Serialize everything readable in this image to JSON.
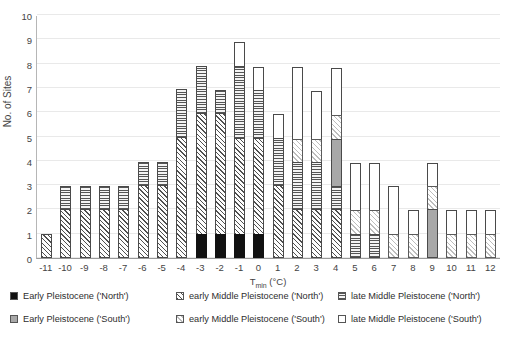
{
  "chart_data": {
    "type": "bar",
    "title": "",
    "xlabel": "Tmin (°C)",
    "xlabel_base": "T",
    "xlabel_sub": "min",
    "xlabel_unit": " (°C)",
    "ylabel": "No. of Sites",
    "ylim": [
      0,
      10
    ],
    "yticks": [
      0,
      1,
      2,
      3,
      4,
      5,
      6,
      7,
      8,
      9,
      10
    ],
    "grid": true,
    "legend_position": "bottom",
    "stacked": true,
    "categories": [
      "-11",
      "-10",
      "-9",
      "-8",
      "-7",
      "-6",
      "-5",
      "-4",
      "-3",
      "-2",
      "-1",
      "0",
      "1",
      "2",
      "3",
      "4",
      "5",
      "6",
      "7",
      "8",
      "9",
      "10",
      "11",
      "12"
    ],
    "series": [
      {
        "name": "Early Pleistocene ('North')",
        "key": "ep_north",
        "pattern": "solid-black",
        "values": [
          0,
          0,
          0,
          0,
          0,
          0,
          0,
          0,
          1,
          1,
          1,
          1,
          0,
          0,
          0,
          0,
          0,
          0,
          0,
          0,
          0,
          0,
          0,
          0
        ]
      },
      {
        "name": "Early Pleistocene ('South')",
        "key": "ep_south",
        "pattern": "solid-gray",
        "values": [
          0,
          0,
          0,
          0,
          0,
          0,
          0,
          0,
          0,
          0,
          0,
          0,
          0,
          0,
          0,
          2,
          0,
          0,
          0,
          0,
          2,
          0,
          0,
          0
        ]
      },
      {
        "name": "early Middle Pleistocene ('North')",
        "key": "emp_north",
        "pattern": "diagonal-hatch",
        "values": [
          1,
          2,
          2,
          2,
          2,
          3,
          3,
          5,
          5,
          5,
          4,
          4,
          3,
          2,
          2,
          2,
          0,
          0,
          0,
          0,
          0,
          0,
          0,
          0
        ]
      },
      {
        "name": "early Middle Pleistocene ('South')",
        "key": "emp_south",
        "pattern": "light-diagonal",
        "values": [
          0,
          0,
          0,
          0,
          0,
          0,
          0,
          0,
          0,
          0,
          0,
          0,
          0,
          1,
          1,
          1,
          1,
          1,
          1,
          1,
          1,
          1,
          1,
          1
        ]
      },
      {
        "name": "late Middle Pleistocene ('North')",
        "key": "lmp_north",
        "pattern": "horizontal-lines",
        "values": [
          0,
          1,
          1,
          1,
          1,
          1,
          1,
          2,
          3,
          2,
          4,
          3,
          3,
          2,
          3,
          1,
          1,
          1,
          0,
          0,
          0,
          0,
          0,
          0
        ]
      },
      {
        "name": "late Middle Pleistocene ('South')",
        "key": "lmp_south",
        "pattern": "white",
        "values": [
          0,
          0,
          0,
          0,
          0,
          0,
          0,
          0,
          0,
          0,
          0,
          1,
          1,
          3,
          2,
          2,
          2,
          2,
          2,
          1,
          1,
          1,
          1,
          1
        ]
      }
    ],
    "bar_stacks": [
      {
        "category": "-11",
        "total": 1,
        "segments": [
          {
            "key": "emp_north",
            "value": 1
          }
        ]
      },
      {
        "category": "-10",
        "total": 3,
        "segments": [
          {
            "key": "emp_north",
            "value": 2
          },
          {
            "key": "lmp_north",
            "value": 1
          }
        ]
      },
      {
        "category": "-9",
        "total": 3,
        "segments": [
          {
            "key": "emp_north",
            "value": 2
          },
          {
            "key": "lmp_north",
            "value": 1
          }
        ]
      },
      {
        "category": "-8",
        "total": 3,
        "segments": [
          {
            "key": "emp_north",
            "value": 2
          },
          {
            "key": "lmp_north",
            "value": 1
          }
        ]
      },
      {
        "category": "-7",
        "total": 3,
        "segments": [
          {
            "key": "emp_north",
            "value": 2
          },
          {
            "key": "lmp_north",
            "value": 1
          }
        ]
      },
      {
        "category": "-6",
        "total": 4,
        "segments": [
          {
            "key": "emp_north",
            "value": 3
          },
          {
            "key": "lmp_north",
            "value": 1
          }
        ]
      },
      {
        "category": "-5",
        "total": 4,
        "segments": [
          {
            "key": "emp_north",
            "value": 3
          },
          {
            "key": "lmp_north",
            "value": 1
          }
        ]
      },
      {
        "category": "-4",
        "total": 7,
        "segments": [
          {
            "key": "emp_north",
            "value": 5
          },
          {
            "key": "lmp_north",
            "value": 2
          }
        ]
      },
      {
        "category": "-3",
        "total": 8,
        "segments": [
          {
            "key": "ep_north",
            "value": 1
          },
          {
            "key": "emp_north",
            "value": 5
          },
          {
            "key": "lmp_north",
            "value": 2
          }
        ]
      },
      {
        "category": "-2",
        "total": 7,
        "segments": [
          {
            "key": "ep_north",
            "value": 1
          },
          {
            "key": "emp_north",
            "value": 5
          },
          {
            "key": "lmp_north",
            "value": 1
          }
        ]
      },
      {
        "category": "-1",
        "total": 9,
        "segments": [
          {
            "key": "ep_north",
            "value": 1
          },
          {
            "key": "emp_north",
            "value": 4
          },
          {
            "key": "lmp_north",
            "value": 3
          },
          {
            "key": "lmp_south",
            "value": 1
          }
        ]
      },
      {
        "category": "0",
        "total": 8,
        "segments": [
          {
            "key": "ep_north",
            "value": 1
          },
          {
            "key": "emp_north",
            "value": 4
          },
          {
            "key": "lmp_north",
            "value": 2
          },
          {
            "key": "lmp_south",
            "value": 1
          }
        ]
      },
      {
        "category": "1",
        "total": 6,
        "segments": [
          {
            "key": "emp_north",
            "value": 3
          },
          {
            "key": "lmp_north",
            "value": 2
          },
          {
            "key": "lmp_south",
            "value": 1
          }
        ]
      },
      {
        "category": "2",
        "total": 8,
        "segments": [
          {
            "key": "emp_north",
            "value": 2
          },
          {
            "key": "lmp_north",
            "value": 2
          },
          {
            "key": "emp_south",
            "value": 1
          },
          {
            "key": "lmp_south",
            "value": 3
          }
        ]
      },
      {
        "category": "3",
        "total": 7,
        "segments": [
          {
            "key": "emp_north",
            "value": 2
          },
          {
            "key": "lmp_north",
            "value": 2
          },
          {
            "key": "emp_south",
            "value": 1
          },
          {
            "key": "lmp_south",
            "value": 2
          }
        ]
      },
      {
        "category": "4",
        "total": 8,
        "segments": [
          {
            "key": "emp_north",
            "value": 2
          },
          {
            "key": "lmp_north",
            "value": 1
          },
          {
            "key": "ep_south",
            "value": 2
          },
          {
            "key": "emp_south",
            "value": 1
          },
          {
            "key": "lmp_south",
            "value": 2
          }
        ]
      },
      {
        "category": "5",
        "total": 4,
        "segments": [
          {
            "key": "lmp_north",
            "value": 1
          },
          {
            "key": "emp_south",
            "value": 1
          },
          {
            "key": "lmp_south",
            "value": 2
          }
        ]
      },
      {
        "category": "6",
        "total": 4,
        "segments": [
          {
            "key": "lmp_north",
            "value": 1
          },
          {
            "key": "emp_south",
            "value": 1
          },
          {
            "key": "lmp_south",
            "value": 2
          }
        ]
      },
      {
        "category": "7",
        "total": 3,
        "segments": [
          {
            "key": "emp_south",
            "value": 1
          },
          {
            "key": "lmp_south",
            "value": 2
          }
        ]
      },
      {
        "category": "8",
        "total": 2,
        "segments": [
          {
            "key": "emp_south",
            "value": 1
          },
          {
            "key": "lmp_south",
            "value": 1
          }
        ]
      },
      {
        "category": "9",
        "total": 4,
        "segments": [
          {
            "key": "ep_south",
            "value": 2
          },
          {
            "key": "emp_south",
            "value": 1
          },
          {
            "key": "lmp_south",
            "value": 1
          }
        ]
      },
      {
        "category": "10",
        "total": 2,
        "segments": [
          {
            "key": "emp_south",
            "value": 1
          },
          {
            "key": "lmp_south",
            "value": 1
          }
        ]
      },
      {
        "category": "11",
        "total": 2,
        "segments": [
          {
            "key": "emp_south",
            "value": 1
          },
          {
            "key": "lmp_south",
            "value": 1
          }
        ]
      },
      {
        "category": "12",
        "total": 2,
        "segments": [
          {
            "key": "emp_south",
            "value": 1
          },
          {
            "key": "lmp_south",
            "value": 1
          }
        ]
      }
    ]
  },
  "legend": {
    "items": [
      {
        "label": "Early Pleistocene  ('North')",
        "key": "ep_north",
        "column": 1,
        "row": 1
      },
      {
        "label": "early Middle Pleistocene ('North')",
        "key": "emp_north",
        "column": 2,
        "row": 1
      },
      {
        "label": "late Middle Pleistocene ('North')",
        "key": "lmp_north",
        "column": 3,
        "row": 1
      },
      {
        "label": "Early Pleistocene ('South')",
        "key": "ep_south",
        "column": 1,
        "row": 2
      },
      {
        "label": "early Middle Pleistocene ('South')",
        "key": "emp_south",
        "column": 2,
        "row": 2
      },
      {
        "label": "late Middle Pleistocene ('South')",
        "key": "lmp_south",
        "column": 3,
        "row": 2
      }
    ]
  },
  "colors": {
    "ep_north": "#111111",
    "ep_south": "#a8a8a8",
    "emp_north": "#fdfdfd",
    "emp_south": "#ffffff",
    "lmp_north": "#f4f4f4",
    "lmp_south": "#ffffff",
    "grid": "#e9e9e9",
    "axis": "#9a9a9a",
    "text": "#444444",
    "background": "#ffffff"
  }
}
